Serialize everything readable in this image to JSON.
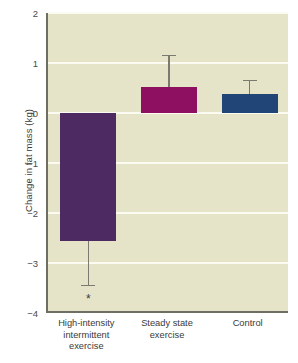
{
  "chart_data": {
    "type": "bar",
    "title": "",
    "subtitle": "",
    "xlabel": "",
    "ylabel": "Change in fat mass (kg)",
    "categories": [
      "High-intensity\nintermittent\nexercise",
      "Steady state\nexercise",
      "Control"
    ],
    "values": [
      -2.55,
      0.52,
      0.38
    ],
    "errors_outer": [
      -3.45,
      1.15,
      0.65
    ],
    "series": [
      {
        "name": "Change in fat mass",
        "values": [
          -2.55,
          0.52,
          0.38
        ],
        "colors": [
          "#4e2a62",
          "#8e1060",
          "#204576"
        ]
      }
    ],
    "annotations": [
      {
        "category": "High-intensity\nintermittent\nexercise",
        "text": "*",
        "y": -3.65
      }
    ],
    "ylim": [
      -4,
      2
    ],
    "yticks": [
      2,
      1,
      0,
      -1,
      -2,
      -3,
      -4
    ],
    "ytick_labels": [
      "2",
      "1",
      "0",
      "−1",
      "−2",
      "−3",
      "−4"
    ],
    "grid": true,
    "legend": "none",
    "plot_background": "#e5e4c9",
    "gridline_color": "#fbfbf2",
    "axis_color": "#6e6e63",
    "errorbar_color": "#7a7a70"
  }
}
